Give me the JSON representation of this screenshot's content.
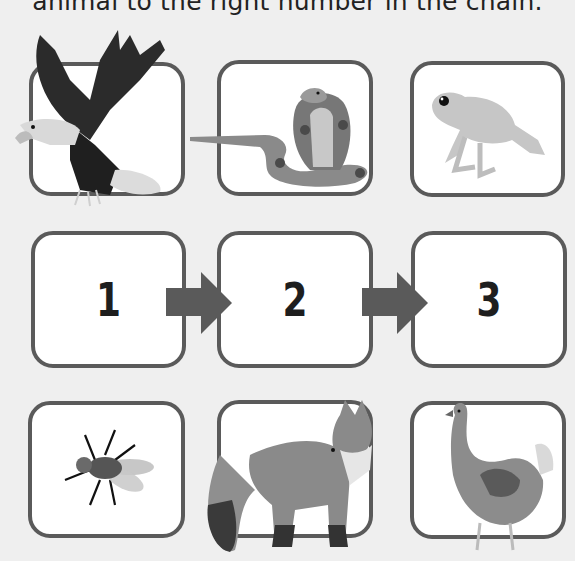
{
  "worksheet": {
    "instruction_text": "animal to the right number in the chain."
  },
  "chain": {
    "numbers": [
      "1",
      "2",
      "3"
    ],
    "arrow_color": "#5a5a5a"
  },
  "animals": {
    "top_row": [
      "eagle",
      "cobra",
      "frog"
    ],
    "bottom_row": [
      "fly",
      "fox",
      "hen"
    ]
  },
  "colors": {
    "background": "#efefef",
    "box_border": "#5a5a5a",
    "box_fill": "#ffffff",
    "number_text": "#1e1e1e"
  }
}
